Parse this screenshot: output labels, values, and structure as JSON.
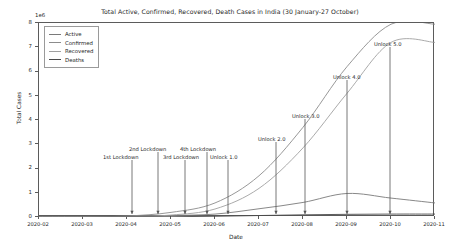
{
  "chart_data": {
    "type": "line",
    "title": "Total Active, Confirmed, Recovered, Death Cases in India (30 January-27 October)",
    "xlabel": "Date",
    "ylabel": "Total Cases",
    "y_offset_label": "1e6",
    "ylim": [
      0,
      8
    ],
    "yticks": [
      0,
      1,
      2,
      3,
      4,
      5,
      6,
      7,
      8
    ],
    "xticks": [
      "2020-02",
      "2020-03",
      "2020-04",
      "2020-05",
      "2020-06",
      "2020-07",
      "2020-08",
      "2020-09",
      "2020-10",
      "2020-11"
    ],
    "grid": false,
    "legend_position": "upper left",
    "x": [
      "2020-02",
      "2020-03",
      "2020-04",
      "2020-05",
      "2020-06",
      "2020-07",
      "2020-08",
      "2020-09",
      "2020-10",
      "2020-11"
    ],
    "series": [
      {
        "name": "Active",
        "color": "#7a7a7a",
        "values": [
          0.0,
          0.0,
          0.02,
          0.06,
          0.12,
          0.34,
          0.6,
          0.97,
          0.78,
          0.58
        ]
      },
      {
        "name": "Confirmed",
        "color": "#8c8c8c",
        "values": [
          0.0,
          0.0,
          0.04,
          0.19,
          0.58,
          1.7,
          3.7,
          6.2,
          7.95,
          7.95
        ]
      },
      {
        "name": "Recovered",
        "color": "#a0a0a0",
        "values": [
          0.0,
          0.0,
          0.01,
          0.08,
          0.33,
          1.18,
          2.85,
          5.1,
          7.2,
          7.2
        ]
      },
      {
        "name": "Deaths",
        "color": "#4a4a4a",
        "values": [
          0.0,
          0.0,
          0.002,
          0.011,
          0.03,
          0.06,
          0.09,
          0.11,
          0.12,
          0.12
        ]
      }
    ],
    "annotations": [
      {
        "label": "1st Lockdown",
        "x_frac": 0.178,
        "label_x": 103,
        "label_y": 154,
        "arrow_x": 132,
        "arrow_top": 160
      },
      {
        "label": "2nd Lockdown",
        "x_frac": 0.252,
        "label_x": 129,
        "label_y": 146,
        "arrow_x": 158,
        "arrow_top": 152
      },
      {
        "label": "3rd Lockdown",
        "x_frac": 0.322,
        "label_x": 163,
        "label_y": 154,
        "arrow_x": 185,
        "arrow_top": 160
      },
      {
        "label": "4th Lockdown",
        "x_frac": 0.378,
        "label_x": 180,
        "label_y": 146,
        "arrow_x": 207,
        "arrow_top": 152
      },
      {
        "label": "Unlock 1.0",
        "x_frac": 0.432,
        "label_x": 210,
        "label_y": 154,
        "arrow_x": 228,
        "arrow_top": 160
      },
      {
        "label": "Unlock 2.0",
        "x_frac": 0.545,
        "label_x": 258,
        "label_y": 136,
        "arrow_x": 276,
        "arrow_top": 142
      },
      {
        "label": "Unlock 3.0",
        "x_frac": 0.64,
        "label_x": 292,
        "label_y": 113,
        "arrow_x": 305,
        "arrow_top": 119
      },
      {
        "label": "Unlock 4.0",
        "x_frac": 0.745,
        "label_x": 333,
        "label_y": 74,
        "arrow_x": 347,
        "arrow_top": 80
      },
      {
        "label": "Unlock 5.0",
        "x_frac": 0.855,
        "label_x": 374,
        "label_y": 41,
        "arrow_x": 390,
        "arrow_top": 47
      }
    ]
  }
}
